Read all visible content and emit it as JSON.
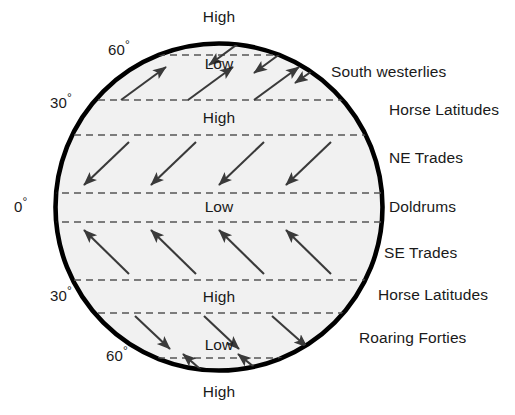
{
  "diagram": {
    "globe": {
      "center_x": 219,
      "center_y": 207,
      "radius": 165,
      "fill_color": "#f1f1f1",
      "stroke_color": "#000000",
      "stroke_width": 4.5
    },
    "latitude_lines": [
      {
        "label": "60",
        "y": 55
      },
      {
        "label": "30-upper",
        "y": 100
      },
      {
        "label": "30-lower",
        "y": 135
      },
      {
        "label": "equator-upper",
        "y": 193
      },
      {
        "label": "equator-lower",
        "y": 222
      },
      {
        "label": "30s-upper",
        "y": 280
      },
      {
        "label": "30s-lower",
        "y": 313
      },
      {
        "label": "60s",
        "y": 358
      }
    ],
    "latitude_labels": [
      {
        "id": "lat-60-north",
        "text": "60",
        "degree": "°",
        "x": 120,
        "y": 42
      },
      {
        "id": "lat-30-north",
        "text": "30",
        "degree": "°",
        "x": 62,
        "y": 95
      },
      {
        "id": "lat-0-equator",
        "text": "0",
        "degree": "°",
        "x": 24,
        "y": 199
      },
      {
        "id": "lat-30-south",
        "text": "30",
        "degree": "°",
        "x": 62,
        "y": 288
      },
      {
        "id": "lat-60-south",
        "text": "60",
        "degree": "°",
        "x": 118,
        "y": 348
      }
    ],
    "pressure_labels": [
      {
        "id": "pressure-high-north-pole",
        "text": "High",
        "x": 219,
        "y": 9
      },
      {
        "id": "pressure-low-subpolar-north",
        "text": "Low",
        "x": 219,
        "y": 56
      },
      {
        "id": "pressure-high-subtropical-north",
        "text": "High",
        "x": 219,
        "y": 110
      },
      {
        "id": "pressure-low-equatorial",
        "text": "Low",
        "x": 219,
        "y": 199
      },
      {
        "id": "pressure-high-subtropical-south",
        "text": "High",
        "x": 219,
        "y": 289
      },
      {
        "id": "pressure-low-subpolar-south",
        "text": "Low",
        "x": 219,
        "y": 337
      },
      {
        "id": "pressure-high-south-pole",
        "text": "High",
        "x": 219,
        "y": 384
      }
    ],
    "wind_belt_labels": [
      {
        "id": "belt-south-westerlies",
        "text": "South westerlies",
        "x": 331,
        "y": 64
      },
      {
        "id": "belt-horse-latitudes-north",
        "text": "Horse Latitudes",
        "x": 389,
        "y": 102
      },
      {
        "id": "belt-ne-trades",
        "text": "NE Trades",
        "x": 389,
        "y": 150
      },
      {
        "id": "belt-doldrums",
        "text": "Doldrums",
        "x": 389,
        "y": 199
      },
      {
        "id": "belt-se-trades",
        "text": "SE Trades",
        "x": 384,
        "y": 245
      },
      {
        "id": "belt-horse-latitudes-south",
        "text": "Horse Latitudes",
        "x": 378,
        "y": 287
      },
      {
        "id": "belt-roaring-forties",
        "text": "Roaring Forties",
        "x": 359,
        "y": 330
      }
    ],
    "wind_arrows": {
      "stroke_color": "#3a3a3a",
      "groups": [
        {
          "belt": "polar-easterlies-north",
          "direction": "down-left",
          "arrows": [
            {
              "x1": 243,
              "y1": 40,
              "x2": 207,
              "y2": 66
            },
            {
              "x1": 288,
              "y1": 48,
              "x2": 252,
              "y2": 74
            },
            {
              "x1": 325,
              "y1": 62,
              "x2": 293,
              "y2": 84
            }
          ]
        },
        {
          "belt": "south-westerlies",
          "direction": "up-right",
          "arrows": [
            {
              "x1": 121,
              "y1": 100,
              "x2": 168,
              "y2": 66
            },
            {
              "x1": 188,
              "y1": 100,
              "x2": 235,
              "y2": 66
            },
            {
              "x1": 254,
              "y1": 100,
              "x2": 301,
              "y2": 66
            }
          ]
        },
        {
          "belt": "ne-trades",
          "direction": "down-left",
          "arrows": [
            {
              "x1": 129,
              "y1": 142,
              "x2": 82,
              "y2": 186
            },
            {
              "x1": 196,
              "y1": 142,
              "x2": 149,
              "y2": 186
            },
            {
              "x1": 264,
              "y1": 142,
              "x2": 217,
              "y2": 186
            },
            {
              "x1": 331,
              "y1": 142,
              "x2": 284,
              "y2": 186
            }
          ]
        },
        {
          "belt": "se-trades",
          "direction": "up-left",
          "arrows": [
            {
              "x1": 129,
              "y1": 274,
              "x2": 82,
              "y2": 229
            },
            {
              "x1": 196,
              "y1": 274,
              "x2": 149,
              "y2": 229
            },
            {
              "x1": 264,
              "y1": 274,
              "x2": 217,
              "y2": 229
            },
            {
              "x1": 331,
              "y1": 274,
              "x2": 284,
              "y2": 229
            }
          ]
        },
        {
          "belt": "roaring-forties",
          "direction": "down-right",
          "arrows": [
            {
              "x1": 135,
              "y1": 316,
              "x2": 172,
              "y2": 350
            },
            {
              "x1": 204,
              "y1": 316,
              "x2": 241,
              "y2": 350
            },
            {
              "x1": 272,
              "y1": 316,
              "x2": 309,
              "y2": 348
            }
          ]
        },
        {
          "belt": "polar-easterlies-south",
          "direction": "up-left",
          "arrows": [
            {
              "x1": 208,
              "y1": 375,
              "x2": 181,
              "y2": 352
            },
            {
              "x1": 265,
              "y1": 375,
              "x2": 236,
              "y2": 352
            }
          ]
        }
      ]
    }
  }
}
